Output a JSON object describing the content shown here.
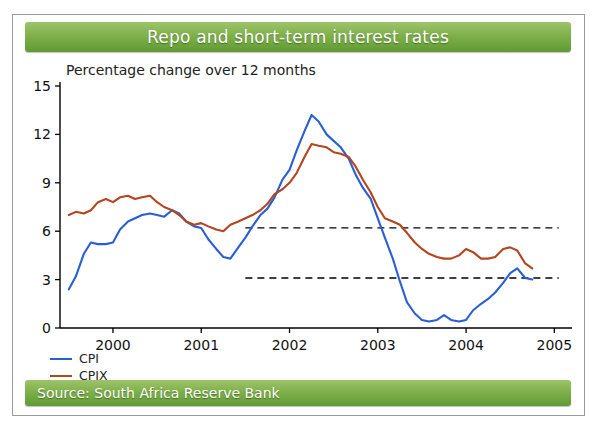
{
  "title": "Repo and short-term interest rates",
  "source": "Source: South Africa Reserve Bank",
  "subtitle": "Percentage change over 12 months",
  "colors": {
    "cpi": "#2a5fd4",
    "cpix": "#b5441f",
    "band": "#000000",
    "bar_green": "#7fb04a",
    "axis": "#000000"
  },
  "legend": [
    {
      "label": "CPI",
      "color": "#2a5fd4"
    },
    {
      "label": "CPIX",
      "color": "#b5441f"
    }
  ],
  "chart_data": {
    "type": "line",
    "title": "Repo and short-term interest rates",
    "subtitle": "Percentage change over 12 months",
    "xlabel": "",
    "ylabel": "",
    "xlim": [
      1999.4,
      2005.2
    ],
    "ylim": [
      0,
      15
    ],
    "yticks": [
      0,
      3,
      6,
      9,
      12,
      15
    ],
    "xticks": [
      2000,
      2001,
      2002,
      2003,
      2004,
      2005
    ],
    "xtick_labels": [
      "2000",
      "2001",
      "2002",
      "2003",
      "2004",
      "2005"
    ],
    "grid": false,
    "legend_position": "bottom-left",
    "annotations": [
      {
        "type": "hline",
        "y": 6.2,
        "style": "dashed",
        "x_start": 2001.5,
        "x_end": 2005.05,
        "label": "inflation target upper limit"
      },
      {
        "type": "hline",
        "y": 3.1,
        "style": "dashed",
        "x_start": 2001.5,
        "x_end": 2005.05,
        "label": "inflation target lower limit"
      }
    ],
    "series": [
      {
        "name": "CPI",
        "color": "#2a5fd4",
        "x": [
          1999.5,
          1999.58,
          1999.67,
          1999.75,
          1999.83,
          1999.92,
          2000.0,
          2000.08,
          2000.17,
          2000.25,
          2000.33,
          2000.42,
          2000.5,
          2000.58,
          2000.67,
          2000.75,
          2000.83,
          2000.92,
          2001.0,
          2001.08,
          2001.17,
          2001.25,
          2001.33,
          2001.42,
          2001.5,
          2001.58,
          2001.67,
          2001.75,
          2001.83,
          2001.92,
          2002.0,
          2002.08,
          2002.17,
          2002.25,
          2002.33,
          2002.42,
          2002.5,
          2002.58,
          2002.67,
          2002.75,
          2002.83,
          2002.92,
          2003.0,
          2003.08,
          2003.17,
          2003.25,
          2003.33,
          2003.42,
          2003.5,
          2003.58,
          2003.67,
          2003.75,
          2003.83,
          2003.92,
          2004.0,
          2004.08,
          2004.17,
          2004.25,
          2004.33,
          2004.42,
          2004.5,
          2004.58,
          2004.67,
          2004.75
        ],
        "y": [
          2.4,
          3.2,
          4.6,
          5.3,
          5.2,
          5.2,
          5.3,
          6.1,
          6.6,
          6.8,
          7.0,
          7.1,
          7.0,
          6.9,
          7.3,
          7.1,
          6.6,
          6.3,
          6.2,
          5.5,
          4.9,
          4.4,
          4.3,
          5.0,
          5.6,
          6.3,
          7.0,
          7.4,
          8.1,
          9.2,
          9.8,
          11.0,
          12.2,
          13.2,
          12.8,
          12.0,
          11.6,
          11.2,
          10.5,
          9.5,
          8.7,
          8.0,
          6.8,
          5.6,
          4.3,
          2.9,
          1.6,
          0.9,
          0.5,
          0.4,
          0.5,
          0.8,
          0.5,
          0.4,
          0.5,
          1.1,
          1.5,
          1.8,
          2.2,
          2.8,
          3.4,
          3.7,
          3.1,
          3.0
        ]
      },
      {
        "name": "CPIX",
        "color": "#b5441f",
        "x": [
          1999.5,
          1999.58,
          1999.67,
          1999.75,
          1999.83,
          1999.92,
          2000.0,
          2000.08,
          2000.17,
          2000.25,
          2000.33,
          2000.42,
          2000.5,
          2000.58,
          2000.67,
          2000.75,
          2000.83,
          2000.92,
          2001.0,
          2001.08,
          2001.17,
          2001.25,
          2001.33,
          2001.42,
          2001.5,
          2001.58,
          2001.67,
          2001.75,
          2001.83,
          2001.92,
          2002.0,
          2002.08,
          2002.17,
          2002.25,
          2002.33,
          2002.42,
          2002.5,
          2002.58,
          2002.67,
          2002.75,
          2002.83,
          2002.92,
          2003.0,
          2003.08,
          2003.17,
          2003.25,
          2003.33,
          2003.42,
          2003.5,
          2003.58,
          2003.67,
          2003.75,
          2003.83,
          2003.92,
          2004.0,
          2004.08,
          2004.17,
          2004.25,
          2004.33,
          2004.42,
          2004.5,
          2004.58,
          2004.67,
          2004.75
        ],
        "y": [
          7.0,
          7.2,
          7.1,
          7.3,
          7.8,
          8.0,
          7.8,
          8.1,
          8.2,
          8.0,
          8.1,
          8.2,
          7.8,
          7.5,
          7.3,
          7.0,
          6.6,
          6.4,
          6.5,
          6.3,
          6.1,
          6.0,
          6.4,
          6.6,
          6.8,
          7.0,
          7.3,
          7.7,
          8.3,
          8.6,
          9.0,
          9.6,
          10.6,
          11.4,
          11.3,
          11.2,
          10.9,
          10.8,
          10.6,
          10.0,
          9.2,
          8.4,
          7.5,
          6.8,
          6.6,
          6.4,
          5.9,
          5.3,
          4.9,
          4.6,
          4.4,
          4.3,
          4.3,
          4.5,
          4.9,
          4.7,
          4.3,
          4.3,
          4.4,
          4.9,
          5.0,
          4.8,
          4.0,
          3.7
        ]
      }
    ]
  }
}
